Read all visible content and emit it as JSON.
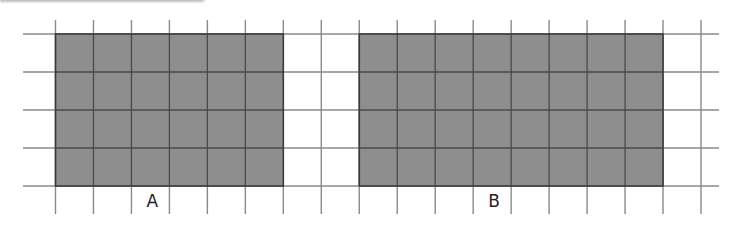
{
  "figure": {
    "grid": {
      "columns": 17,
      "rows": 4
    },
    "colors": {
      "fill": "#8e8e8e",
      "rect_border": "#3a3a3a",
      "grid_line": "#8a8a8a"
    },
    "shapes": [
      {
        "label": "A",
        "start_column": 0,
        "width_units": 6,
        "height_units": 4
      },
      {
        "label": "B",
        "start_column": 8,
        "width_units": 8,
        "height_units": 4
      }
    ]
  }
}
